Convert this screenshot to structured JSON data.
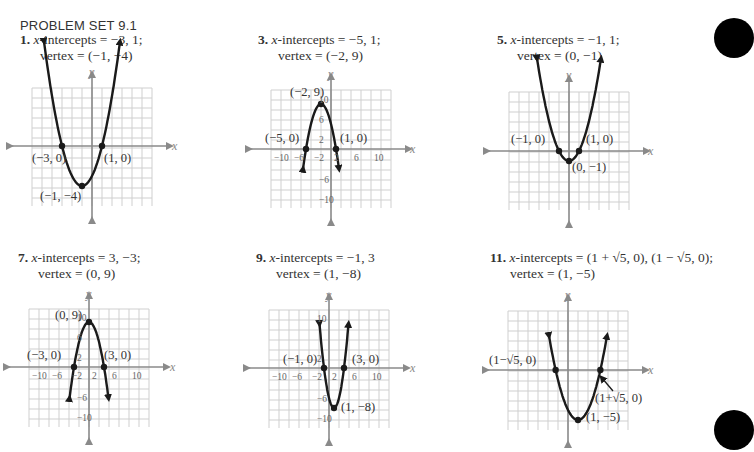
{
  "page": {
    "set_title": "PROBLEM SET 9.1"
  },
  "problems": [
    {
      "number": "1.",
      "line1_pre": "x",
      "line1": "-intercepts  =  −3, 1;",
      "line2": "vertex  =  (−1,  −4)"
    },
    {
      "number": "3.",
      "line1_pre": "x",
      "line1": "-intercepts  =  −5, 1;",
      "line2": "vertex  =  (−2, 9)"
    },
    {
      "number": "5.",
      "line1_pre": "x",
      "line1": "-intercepts  =  −1, 1;",
      "line2": "vertex  =  (0,  −1)"
    },
    {
      "number": "7.",
      "line1_pre": "x",
      "line1": "-intercepts  =  3,  −3;",
      "line2": "vertex  =  (0, 9)"
    },
    {
      "number": "9.",
      "line1_pre": "x",
      "line1": "-intercepts  =  −1, 3",
      "line2": "vertex  =  (1,  −8)"
    },
    {
      "number": "11.",
      "line1_pre": "x",
      "line1": "-intercepts  =  (1 + √5, 0), (1 − √5, 0);",
      "line2": "vertex  =  (1,  −5)"
    }
  ],
  "graphs": [
    {
      "id": "g1",
      "axis_x_label": "x",
      "axis_y_label": "y",
      "point_labels": [
        "(−3, 0)",
        "(1, 0)",
        "(−1, −4)"
      ],
      "tick_labels": []
    },
    {
      "id": "g3",
      "axis_x_label": "x",
      "axis_y_label": "y",
      "point_labels": [
        "(−2, 9)",
        "(−5, 0)",
        "(1, 0)"
      ],
      "tick_labels_x": [
        "−10",
        "−6",
        "−2",
        "2",
        "6",
        "10"
      ],
      "tick_labels_y": [
        "10",
        "6",
        "2",
        "−6",
        "−10"
      ]
    },
    {
      "id": "g5",
      "axis_x_label": "x",
      "axis_y_label": "y",
      "point_labels": [
        "(−1, 0)",
        "(1, 0)",
        "(0, −1)"
      ]
    },
    {
      "id": "g7",
      "axis_x_label": "x",
      "axis_y_label": "y",
      "point_labels": [
        "(0, 9)",
        "(−3, 0)",
        "(3, 0)"
      ],
      "tick_labels_x": [
        "−10",
        "−6",
        "−2",
        "2",
        "6",
        "10"
      ],
      "tick_labels_y": [
        "10",
        "6",
        "2",
        "−6",
        "−10"
      ]
    },
    {
      "id": "g9",
      "axis_x_label": "x",
      "axis_y_label": "y",
      "point_labels": [
        "(−1, 0)",
        "(3, 0)",
        "(1, −8)"
      ],
      "tick_labels_x": [
        "−10",
        "−6",
        "−2",
        "2",
        "6",
        "10"
      ],
      "tick_labels_y": [
        "10",
        "6",
        "2",
        "−6",
        "−10"
      ]
    },
    {
      "id": "g11",
      "axis_x_label": "x",
      "axis_y_label": "y",
      "point_labels": [
        "(1−√5, 0)",
        "(1+√5, 0)",
        "(1, −5)"
      ]
    }
  ],
  "chart_data": [
    {
      "type": "line",
      "title": "1. y = (x+3)(x−1)",
      "function": "x^2+2x-3",
      "x_intercepts": [
        -3,
        1
      ],
      "vertex": [
        -1,
        -4
      ],
      "xlim": [
        -6,
        6
      ],
      "ylim": [
        -6,
        6
      ],
      "grid": true,
      "scale_per_cell": 1
    },
    {
      "type": "line",
      "title": "3. y = −(x+5)(x−1)",
      "function": "-(x^2+4x-5)",
      "x_intercepts": [
        -5,
        1
      ],
      "vertex": [
        -2,
        9
      ],
      "xlim": [
        -12,
        12
      ],
      "ylim": [
        -12,
        12
      ],
      "grid": true,
      "scale_per_cell": 2
    },
    {
      "type": "line",
      "title": "5. y = x^2 − 1",
      "function": "x^2-1",
      "x_intercepts": [
        -1,
        1
      ],
      "vertex": [
        0,
        -1
      ],
      "xlim": [
        -6,
        6
      ],
      "ylim": [
        -6,
        6
      ],
      "grid": true,
      "scale_per_cell": 1
    },
    {
      "type": "line",
      "title": "7. y = 9 − x^2",
      "function": "9-x^2",
      "x_intercepts": [
        3,
        -3
      ],
      "vertex": [
        0,
        9
      ],
      "xlim": [
        -12,
        12
      ],
      "ylim": [
        -12,
        12
      ],
      "grid": true,
      "scale_per_cell": 2
    },
    {
      "type": "line",
      "title": "9. y = 2(x+1)(x−3)",
      "function": "2x^2-4x-6",
      "x_intercepts": [
        -1,
        3
      ],
      "vertex": [
        1,
        -8
      ],
      "xlim": [
        -12,
        12
      ],
      "ylim": [
        -12,
        12
      ],
      "grid": true,
      "scale_per_cell": 2
    },
    {
      "type": "line",
      "title": "11. y = (x−1)^2 − 5",
      "function": "x^2-2x-4",
      "x_intercepts": [
        3.236,
        -1.236
      ],
      "vertex": [
        1,
        -5
      ],
      "xlim": [
        -6,
        6
      ],
      "ylim": [
        -6,
        6
      ],
      "grid": true,
      "scale_per_cell": 1
    }
  ],
  "colors": {
    "grid": "#cfcfcf",
    "axis": "#8a8a8a",
    "curve": "#1a1a1a",
    "text": "#333333",
    "tab": "#000000"
  }
}
